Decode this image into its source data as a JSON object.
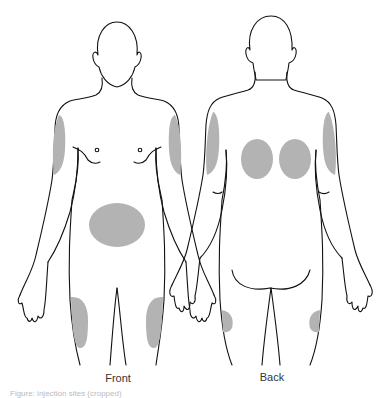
{
  "diagram": {
    "type": "body-outline-injection-sites",
    "views": [
      {
        "label": "Front",
        "shaded_regions": [
          "left-upper-arm",
          "right-upper-arm",
          "abdomen",
          "left-thigh",
          "right-thigh"
        ]
      },
      {
        "label": "Back",
        "shaded_regions": [
          "left-upper-arm",
          "right-upper-arm",
          "left-upper-buttock-area",
          "right-upper-buttock-area",
          "left-outer-thigh",
          "right-outer-thigh"
        ]
      }
    ],
    "colors": {
      "outline": "#111111",
      "shaded": "#b0b0b0",
      "background": "#ffffff"
    }
  },
  "labels": {
    "front": "Front",
    "back": "Back"
  },
  "caption": "Figure: injection sites (cropped)"
}
